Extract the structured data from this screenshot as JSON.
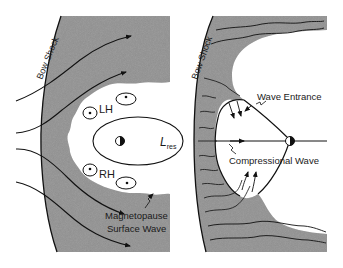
{
  "figure": {
    "colors": {
      "background": "#ffffff",
      "shocked_region": "#8c8c8c",
      "lines": "#111111",
      "text": "#1a1a1a"
    },
    "left_panel": {
      "bow_shock_label": "Bow Shock",
      "vortex_labels": [
        "LH",
        "RH"
      ],
      "resonance_label_main": "L",
      "resonance_label_sub": "res",
      "surface_wave_label_line1": "Magnetopause",
      "surface_wave_label_line2": "Surface Wave",
      "earth_icon": "half-filled-circle"
    },
    "right_panel": {
      "bow_shock_label": "Bow Shock",
      "wave_entrance_label": "Wave Entrance",
      "compressional_wave_label": "Compressional Wave",
      "earth_icon": "half-filled-circle"
    }
  }
}
